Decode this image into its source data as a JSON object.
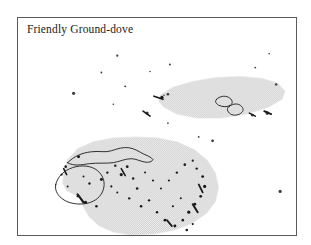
{
  "figure": {
    "kind": "species-range-map",
    "width": 311,
    "height": 245,
    "background_color": "#ffffff"
  },
  "map": {
    "title": "Friendly Ground-dove",
    "frame": {
      "border_color": "#5b5b5b",
      "fill_color": "#ffffff",
      "x": 17,
      "y": 17,
      "width": 280,
      "height": 219
    },
    "legend_note": "",
    "colors": {
      "range_shading": "#dcdcdc",
      "range_shading_dot": "#c9c9c9",
      "coastline": "#1a1a1a",
      "island_dot": "#1a1a1a",
      "title_text": "#1b1b1b"
    },
    "range_polygons": [
      {
        "name": "northeast-range-band",
        "label": "Fiji - Samoa band",
        "points": "143,78 156,70 176,64 200,60 224,59 246,61 262,66 269,74 266,82 252,90 230,97 205,101 180,101 160,97 147,90 142,84"
      },
      {
        "name": "main-southwest-range",
        "label": "Melanesia main range",
        "points": "46,157 50,143 60,132 76,125 96,121 118,120 140,121 160,125 178,133 191,144 199,157 202,171 199,185 190,197 176,207 158,214 136,218 114,219 96,216 82,210 72,201 66,191 62,181 56,178 49,174 45,167"
      }
    ],
    "coastline_outlines": [
      {
        "name": "new-guinea-outline",
        "path": "M 50 146 C 56 140, 64 136, 74 135 C 82 134, 88 136, 94 134 C 100 132, 106 130, 112 131 C 118 132, 122 135, 126 137 C 130 139, 134 140, 136 143 C 134 146, 130 146, 126 145 C 122 144, 118 142, 114 142 C 108 142, 102 145, 96 146 C 88 147, 80 146, 72 147 C 64 148, 56 150, 50 146 Z"
      },
      {
        "name": "large-island-outline",
        "path": "M 38 168 C 40 160, 46 154, 55 151 C 64 148, 74 149, 80 154 C 86 159, 88 166, 86 173 C 84 180, 78 185, 70 187 C 60 189, 50 187, 44 182 C 39 178, 37 173, 38 168 Z"
      },
      {
        "name": "fiji-viti-levu-outline",
        "path": "M 200 82 C 203 79, 208 78, 212 80 C 216 82, 217 86, 214 88 C 211 90, 206 90, 202 88 C 199 86, 198 84, 200 82 Z"
      },
      {
        "name": "fiji-vanua-levu-outline",
        "path": "M 213 89 C 217 86, 222 86, 225 89 C 228 92, 227 95, 223 97 C 219 99, 214 98, 212 95 C 210 92, 211 90, 213 89 Z"
      }
    ],
    "island_dots": [
      {
        "x": 100,
        "y": 38,
        "r": 1.1
      },
      {
        "x": 84,
        "y": 55,
        "r": 0.9
      },
      {
        "x": 153,
        "y": 47,
        "r": 1.0
      },
      {
        "x": 239,
        "y": 50,
        "r": 0.9
      },
      {
        "x": 253,
        "y": 36,
        "r": 0.8
      },
      {
        "x": 56,
        "y": 76,
        "r": 1.6
      },
      {
        "x": 108,
        "y": 69,
        "r": 1.0
      },
      {
        "x": 133,
        "y": 54,
        "r": 0.8
      },
      {
        "x": 96,
        "y": 87,
        "r": 0.8
      },
      {
        "x": 130,
        "y": 96,
        "r": 1.6
      },
      {
        "x": 151,
        "y": 106,
        "r": 0.9
      },
      {
        "x": 182,
        "y": 120,
        "r": 0.9
      },
      {
        "x": 196,
        "y": 124,
        "r": 1.4
      },
      {
        "x": 147,
        "y": 78,
        "r": 0.8
      },
      {
        "x": 281,
        "y": 88,
        "r": 1.0
      },
      {
        "x": 264,
        "y": 175,
        "r": 1.6
      },
      {
        "x": 177,
        "y": 232,
        "r": 0.8
      },
      {
        "x": 260,
        "y": 67,
        "r": 1.2
      },
      {
        "x": 151,
        "y": 77,
        "r": 1.3
      },
      {
        "x": 236,
        "y": 98,
        "r": 1.4
      },
      {
        "x": 251,
        "y": 96,
        "r": 1.8
      }
    ],
    "range_islands": [
      {
        "x": 145,
        "y": 80,
        "r": 1.6
      },
      {
        "x": 61,
        "y": 140,
        "r": 1.5
      },
      {
        "x": 48,
        "y": 150,
        "r": 1.3
      },
      {
        "x": 44,
        "y": 158,
        "r": 1.1
      },
      {
        "x": 50,
        "y": 170,
        "r": 1.0
      },
      {
        "x": 60,
        "y": 180,
        "r": 1.1
      },
      {
        "x": 68,
        "y": 186,
        "r": 1.6
      },
      {
        "x": 79,
        "y": 190,
        "r": 1.3
      },
      {
        "x": 84,
        "y": 163,
        "r": 1.5
      },
      {
        "x": 90,
        "y": 156,
        "r": 1.2
      },
      {
        "x": 98,
        "y": 149,
        "r": 1.2
      },
      {
        "x": 104,
        "y": 158,
        "r": 1.6
      },
      {
        "x": 110,
        "y": 150,
        "r": 1.4
      },
      {
        "x": 116,
        "y": 162,
        "r": 1.2
      },
      {
        "x": 120,
        "y": 172,
        "r": 1.3
      },
      {
        "x": 112,
        "y": 182,
        "r": 1.2
      },
      {
        "x": 100,
        "y": 176,
        "r": 1.0
      },
      {
        "x": 94,
        "y": 170,
        "r": 1.1
      },
      {
        "x": 124,
        "y": 190,
        "r": 1.3
      },
      {
        "x": 132,
        "y": 184,
        "r": 1.2
      },
      {
        "x": 140,
        "y": 196,
        "r": 1.2
      },
      {
        "x": 148,
        "y": 204,
        "r": 1.4
      },
      {
        "x": 158,
        "y": 210,
        "r": 1.5
      },
      {
        "x": 166,
        "y": 204,
        "r": 1.3
      },
      {
        "x": 172,
        "y": 196,
        "r": 1.6
      },
      {
        "x": 178,
        "y": 188,
        "r": 1.5
      },
      {
        "x": 184,
        "y": 180,
        "r": 1.4
      },
      {
        "x": 188,
        "y": 170,
        "r": 1.6
      },
      {
        "x": 186,
        "y": 160,
        "r": 1.4
      },
      {
        "x": 180,
        "y": 152,
        "r": 1.2
      },
      {
        "x": 176,
        "y": 144,
        "r": 1.1
      },
      {
        "x": 168,
        "y": 148,
        "r": 1.3
      },
      {
        "x": 160,
        "y": 156,
        "r": 1.2
      },
      {
        "x": 152,
        "y": 164,
        "r": 1.1
      },
      {
        "x": 144,
        "y": 172,
        "r": 1.0
      },
      {
        "x": 136,
        "y": 164,
        "r": 1.1
      },
      {
        "x": 128,
        "y": 156,
        "r": 1.0
      },
      {
        "x": 156,
        "y": 190,
        "r": 1.1
      },
      {
        "x": 164,
        "y": 182,
        "r": 1.0
      },
      {
        "x": 170,
        "y": 214,
        "r": 1.3
      },
      {
        "x": 176,
        "y": 208,
        "r": 1.1
      },
      {
        "x": 72,
        "y": 167,
        "r": 1.2
      },
      {
        "x": 66,
        "y": 160,
        "r": 1.0
      }
    ],
    "range_streaks": [
      {
        "x1": 60,
        "y1": 178,
        "x2": 66,
        "y2": 186,
        "w": 2.2
      },
      {
        "x1": 176,
        "y1": 188,
        "x2": 181,
        "y2": 196,
        "w": 2.0
      },
      {
        "x1": 182,
        "y1": 168,
        "x2": 186,
        "y2": 176,
        "w": 1.8
      },
      {
        "x1": 104,
        "y1": 152,
        "x2": 108,
        "y2": 159,
        "w": 1.6
      },
      {
        "x1": 46,
        "y1": 152,
        "x2": 49,
        "y2": 158,
        "w": 1.6
      },
      {
        "x1": 150,
        "y1": 204,
        "x2": 155,
        "y2": 210,
        "w": 1.8
      },
      {
        "x1": 137,
        "y1": 79,
        "x2": 146,
        "y2": 82,
        "w": 1.8
      },
      {
        "x1": 233,
        "y1": 96,
        "x2": 239,
        "y2": 99,
        "w": 1.6
      },
      {
        "x1": 248,
        "y1": 94,
        "x2": 255,
        "y2": 97,
        "w": 1.8
      },
      {
        "x1": 126,
        "y1": 94,
        "x2": 133,
        "y2": 99,
        "w": 1.7
      }
    ]
  }
}
